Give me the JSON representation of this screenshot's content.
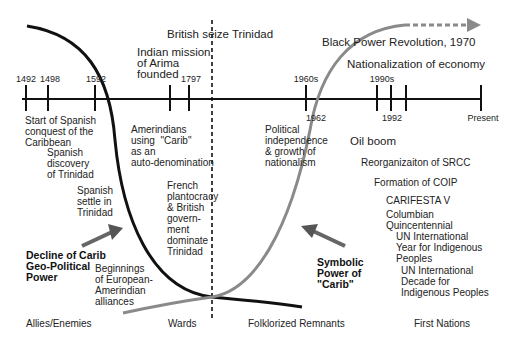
{
  "title_top": {
    "british": "British seize Trinidad",
    "black_power": "Black Power Revolution, 1970",
    "nationalization": "Nationalization of economy",
    "indian_mission": "Indian mission\nof Arima\nfounded"
  },
  "timeline": {
    "ticks_above": [
      {
        "label": "1492",
        "x": 22
      },
      {
        "label": "1498",
        "x": 44
      },
      {
        "label": "1592",
        "x": 94
      },
      {
        "label": "1797",
        "x": 189
      },
      {
        "label": "1960s",
        "x": 306
      },
      {
        "label": "1990s",
        "x": 377
      }
    ],
    "ticks_below": [
      {
        "label": "1962",
        "x": 315
      },
      {
        "label": "1992",
        "x": 391
      },
      {
        "label": "Present",
        "x": 482
      }
    ],
    "tick_positions": [
      22,
      44,
      94,
      170,
      189,
      306,
      377,
      391,
      406,
      482
    ]
  },
  "events": {
    "start_conquest": "Start of Spanish\nconquest of the\nCaribbean",
    "spanish_discovery": "Spanish\ndiscovery\nof Trinidad",
    "spanish_settle": "Spanish\nsettle in\nTrinidad",
    "amerindians_carib": "Amerindians\nusing  \"Carib\"\nas an\nauto-denomination",
    "french_plantocracy": "French\nplantocracy\n& British\ngovern-\nment\ndominate\nTrinidad",
    "political_independence": "Political\nindependence\n& growth of\nnationalism",
    "oil_boom": "Oil boom",
    "reorganization": "Reorganizaiton of SRCC",
    "formation": "Formation of COIP",
    "carifesta": "CARIFESTA V",
    "columbian": "Columbian\nQuincentennial",
    "un_year": "UN International\nYear for Indigenous\nPeoples",
    "un_decade": "UN International\nDecade for\nIndigenous Peoples",
    "beginnings": "Beginnings\nof European-\nAmerindian\nalliances"
  },
  "annotations": {
    "decline": "Decline of Carib\nGeo-Political\nPower",
    "symbolic": "Symbolic\nPower of\n\"Carib\""
  },
  "phases": [
    "Allies/Enemies",
    "Wards",
    "Folklorized Remnants",
    "First Nations"
  ],
  "colors": {
    "black_curve": "#111111",
    "gray_curve": "#8a8a8a",
    "axis": "#111111"
  }
}
